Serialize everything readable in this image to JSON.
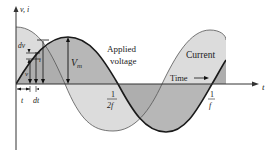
{
  "diagram": {
    "axes": {
      "vertical_label": "v, i",
      "horizontal_label": "t"
    },
    "labels": {
      "applied_voltage_line1": "Applied",
      "applied_voltage_line2": "voltage",
      "current": "Current",
      "time": "Time",
      "time_arrow": "→",
      "peak_voltage": "V",
      "peak_voltage_sub": "m",
      "dv": "dv",
      "current_symbol": "i",
      "v_symbol": "v",
      "t_label": "t",
      "dt_label": "dt",
      "half_period_num": "1",
      "half_period_den": "2f",
      "period_num": "1",
      "period_den": "f"
    },
    "colors": {
      "current_fill": "#dcdcdc",
      "voltage_fill": "#b0b0b0",
      "overlap_fill": "#9c9c9c",
      "curve_line": "#1a1a1a",
      "axis": "#333333"
    }
  }
}
